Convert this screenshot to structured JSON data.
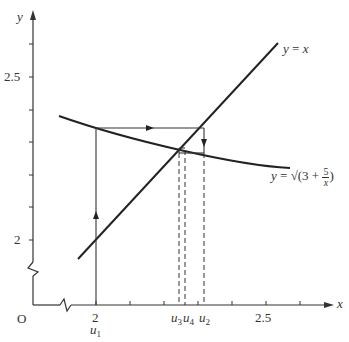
{
  "diagram": {
    "type": "cobweb-iteration",
    "axes": {
      "x_label": "x",
      "y_label": "y",
      "origin_label": "O",
      "x_ticks": [
        "2",
        "2.5"
      ],
      "y_ticks": [
        "2",
        "2.5"
      ],
      "x_broken": true,
      "y_broken": true
    },
    "curves": [
      {
        "name": "identity-line",
        "label_lhs": "y",
        "label_eq": "=",
        "label_rhs": "x"
      },
      {
        "name": "g-curve",
        "label_lhs": "y",
        "label_eq": "=",
        "label_sqrt": "√(3 +",
        "frac_num": "5",
        "frac_den": "x",
        "label_close": ")"
      }
    ],
    "iterates": [
      {
        "base": "u",
        "sub": "1"
      },
      {
        "base": "u",
        "sub": "3"
      },
      {
        "base": "u",
        "sub": "4"
      },
      {
        "base": "u",
        "sub": "2"
      }
    ],
    "colors": {
      "ink": "#222222",
      "background": "#ffffff"
    }
  }
}
